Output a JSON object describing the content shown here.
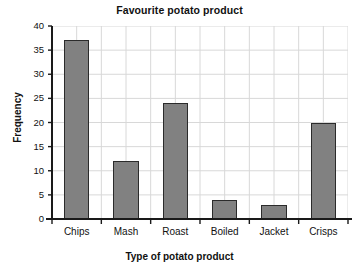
{
  "chart_data": {
    "type": "bar",
    "title": "Favourite potato product",
    "xlabel": "Type of potato product",
    "ylabel": "Frequency",
    "categories": [
      "Chips",
      "Mash",
      "Roast",
      "Boiled",
      "Jacket",
      "Crisps"
    ],
    "values": [
      37,
      12,
      24,
      4,
      3,
      20
    ],
    "ylim": [
      0,
      40
    ],
    "ytick_labels": [
      "0",
      "5",
      "10",
      "15",
      "20",
      "25",
      "30",
      "35",
      "40"
    ],
    "ytick_values": [
      0,
      5,
      10,
      15,
      20,
      25,
      30,
      35,
      40
    ],
    "grid": true,
    "legend": "none",
    "colors": {
      "bar_fill": "#818181",
      "bar_edge": "#2b2b2b",
      "grid": "#d8d8d8",
      "axis": "#1a1a1a",
      "background": "#ffffff",
      "text": "#111111"
    }
  }
}
